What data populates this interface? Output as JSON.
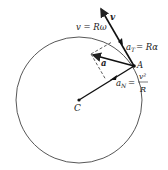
{
  "diagram": {
    "circle": {
      "cx": 79,
      "cy": 100,
      "r": 63
    },
    "center_label": "C",
    "point_label": "A",
    "velocity": {
      "symbol": "v",
      "formula": "v = Rω"
    },
    "tangential": {
      "formula": "aT = Rα",
      "sym": "a",
      "sub": "T",
      "rhs": "= Rα"
    },
    "acceleration": {
      "symbol": "a"
    },
    "normal": {
      "sym": "a",
      "sub": "N",
      "eq": "=",
      "num": "v²",
      "den": "R"
    }
  }
}
